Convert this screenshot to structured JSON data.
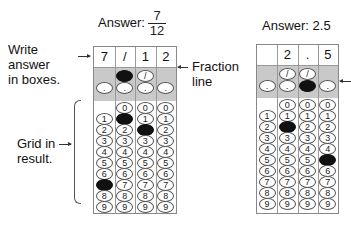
{
  "left": {
    "answer_label": "Answer:",
    "fraction": {
      "numerator": "7",
      "denominator": "12"
    },
    "boxes": [
      "7",
      "/",
      "1",
      "2"
    ],
    "filled": {
      "slash": [
        1
      ],
      "dot": [],
      "digits": [
        7,
        1,
        2
      ]
    },
    "labels": {
      "write_answer": [
        "Write",
        "answer",
        "in boxes."
      ],
      "grid_in": [
        "Grid in",
        "result."
      ],
      "fraction_line": [
        "Fraction",
        "line"
      ]
    }
  },
  "right": {
    "answer_label": "Answer: 2.5",
    "boxes": [
      "",
      "2",
      ".",
      "5"
    ],
    "filled": {
      "slash": [],
      "dot": [
        2
      ],
      "digits": [
        null,
        2,
        null,
        5
      ]
    }
  },
  "bubble_symbols": {
    "slash": "/",
    "dot": ".",
    "digits": [
      "0",
      "1",
      "2",
      "3",
      "4",
      "5",
      "6",
      "7",
      "8",
      "9"
    ]
  },
  "colors": {
    "shade": "#c9c9c9",
    "fill": "#111111",
    "border": "#888888"
  }
}
